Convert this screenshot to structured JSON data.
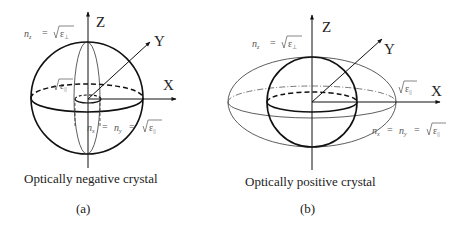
{
  "panels": [
    {
      "id": "a",
      "caption": "Optically negative crystal",
      "sublabel": "(a)",
      "axes": {
        "z": "Z",
        "y": "Y",
        "x": "X"
      },
      "equations": {
        "nz": {
          "lhs": "n",
          "sub": "z",
          "eq": "=",
          "rad": "ε",
          "radsub": "⊥"
        },
        "nxy": {
          "lhs1": "n",
          "sub1": "x",
          "eq1": "=",
          "lhs2": "n",
          "sub2": "y",
          "eq2": "=",
          "rad": "ε",
          "radsub": "||"
        },
        "inner": {
          "rad": "ε",
          "radsub": "||"
        }
      }
    },
    {
      "id": "b",
      "caption": "Optically positive crystal",
      "sublabel": "(b)",
      "axes": {
        "z": "Z",
        "y": "Y",
        "x": "X"
      },
      "equations": {
        "nz": {
          "lhs": "n",
          "sub": "z",
          "eq": "=",
          "rad": "ε",
          "radsub": "⊥"
        },
        "nxy": {
          "lhs1": "n",
          "sub1": "x",
          "eq1": "=",
          "lhs2": "n",
          "sub2": "y",
          "eq2": "=",
          "rad": "ε",
          "radsub": "||"
        },
        "outer": {
          "rad": "ε",
          "radsub": "||"
        }
      }
    }
  ]
}
